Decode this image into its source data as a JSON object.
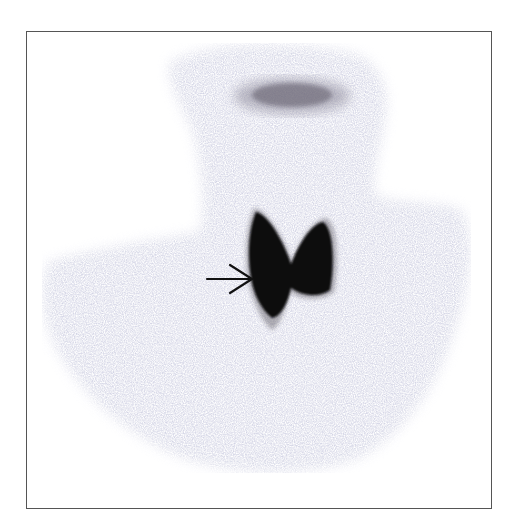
{
  "image": {
    "type": "thyroid scintigraphy (anterior view)",
    "annotation": {
      "type": "arrow",
      "direction": "right",
      "points_to": "right thyroid lobe"
    },
    "colors": {
      "background": "#ffffff",
      "frame": "#555555",
      "body_uptake": "#c9c9dc",
      "salivary_uptake": "#6a6670",
      "thyroid_uptake": "#0a0a0a",
      "arrow": "#111111"
    }
  }
}
